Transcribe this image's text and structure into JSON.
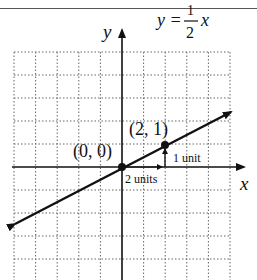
{
  "chart_data": {
    "type": "line",
    "equation": {
      "lhs": "y =",
      "numerator": "1",
      "denominator": "2",
      "var": "x"
    },
    "xlabel": "x",
    "ylabel": "y",
    "xlim": [
      -5,
      5
    ],
    "ylim": [
      -4,
      5
    ],
    "grid": true,
    "series": [
      {
        "name": "y = 1/2 x",
        "x": [
          -5,
          5
        ],
        "y": [
          -2.5,
          2.5
        ]
      }
    ],
    "points": [
      {
        "x": 0,
        "y": 0,
        "label": "(0, 0)"
      },
      {
        "x": 2,
        "y": 1,
        "label": "(2, 1)"
      }
    ],
    "annotations": [
      {
        "text": "2 units",
        "type": "run",
        "from": [
          0,
          0
        ],
        "to": [
          2,
          0
        ]
      },
      {
        "text": "1 unit",
        "type": "rise",
        "from": [
          2,
          0
        ],
        "to": [
          2,
          1
        ]
      }
    ]
  },
  "labels": {
    "x_axis": "x",
    "y_axis": "y",
    "eq_lhs": "y =",
    "eq_num": "1",
    "eq_den": "2",
    "eq_var": "x",
    "origin": "(0, 0)",
    "point": "(2, 1)",
    "run": "2 units",
    "rise": "1 unit"
  }
}
